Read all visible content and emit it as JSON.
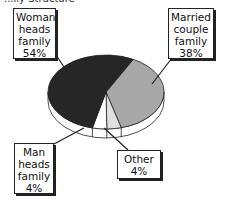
{
  "chart_data": {
    "type": "pie",
    "title": "...ily Structure",
    "style": "3d",
    "slices": [
      {
        "label_lines": [
          "Woman",
          "heads",
          "family",
          "54%"
        ],
        "label": "Woman heads family",
        "value": 54,
        "color": "#262626"
      },
      {
        "label_lines": [
          "Married",
          "couple",
          "family",
          "38%"
        ],
        "label": "Married couple family",
        "value": 38,
        "color": "#a8a8a8"
      },
      {
        "label_lines": [
          "Other",
          "4%"
        ],
        "label": "Other",
        "value": 4,
        "color": "#e0e0e0"
      },
      {
        "label_lines": [
          "Man",
          "heads",
          "family",
          "4%"
        ],
        "label": "Man heads family",
        "value": 4,
        "color": "#ffffff"
      }
    ],
    "side_color": "#ffffff",
    "edge_color": "#222222"
  }
}
